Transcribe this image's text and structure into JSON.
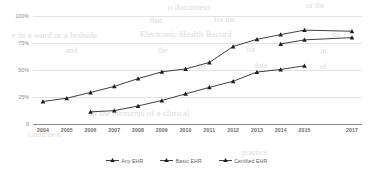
{
  "chart_data": {
    "type": "line",
    "title": "",
    "subtitle": "",
    "xlabel": "",
    "ylabel": "",
    "x": [
      2004,
      2005,
      2006,
      2007,
      2008,
      2009,
      2010,
      2011,
      2012,
      2013,
      2014,
      2015,
      2016,
      2017
    ],
    "tick_labels": [
      "2004",
      "2005",
      "2006",
      "2007",
      "2008",
      "2009",
      "2010",
      "2011",
      "2012",
      "2013",
      "2014",
      "2015",
      "2017"
    ],
    "ytick_labels": [
      "0",
      "25%",
      "50%",
      "75%",
      "100%"
    ],
    "ytick_values": [
      0,
      25,
      50,
      75,
      100
    ],
    "ylim": [
      0,
      100
    ],
    "grid": true,
    "legend_position": "bottom",
    "series": [
      {
        "name": "Any EHR",
        "marker": "triangle",
        "color": "#1f1f1f",
        "points": [
          {
            "x": 2004,
            "y": 20.8
          },
          {
            "x": 2005,
            "y": 23.9
          },
          {
            "x": 2006,
            "y": 29.2
          },
          {
            "x": 2007,
            "y": 34.8
          },
          {
            "x": 2008,
            "y": 42.0
          },
          {
            "x": 2009,
            "y": 48.3
          },
          {
            "x": 2010,
            "y": 51.0
          },
          {
            "x": 2011,
            "y": 57.0
          },
          {
            "x": 2012,
            "y": 71.8
          },
          {
            "x": 2013,
            "y": 78.4
          },
          {
            "x": 2014,
            "y": 82.8
          },
          {
            "x": 2015,
            "y": 86.9
          },
          {
            "x": 2017,
            "y": 85.9
          }
        ]
      },
      {
        "name": "Basic EHR",
        "marker": "triangle",
        "color": "#1f1f1f",
        "points": [
          {
            "x": 2006,
            "y": 11.2
          },
          {
            "x": 2007,
            "y": 12.4
          },
          {
            "x": 2008,
            "y": 16.7
          },
          {
            "x": 2009,
            "y": 21.8
          },
          {
            "x": 2010,
            "y": 27.9
          },
          {
            "x": 2011,
            "y": 33.9
          },
          {
            "x": 2012,
            "y": 39.6
          },
          {
            "x": 2013,
            "y": 48.1
          },
          {
            "x": 2014,
            "y": 50.5
          },
          {
            "x": 2015,
            "y": 53.9
          }
        ]
      },
      {
        "name": "Certified EHR",
        "marker": "triangle",
        "color": "#1f1f1f",
        "points": [
          {
            "x": 2014,
            "y": 74.1
          },
          {
            "x": 2015,
            "y": 77.9
          },
          {
            "x": 2017,
            "y": 80.0
          }
        ]
      }
    ]
  },
  "legend": {
    "items": [
      {
        "label": "Any EHR"
      },
      {
        "label": "Basic EHR"
      },
      {
        "label": "Certified EHR"
      }
    ]
  },
  "background_text": [
    {
      "text": "o document",
      "x": 168,
      "y": 2,
      "size": 9
    },
    {
      "text": "of the",
      "x": 306,
      "y": 1,
      "size": 8
    },
    {
      "text": "that",
      "x": 150,
      "y": 16,
      "size": 8
    },
    {
      "text": "for the",
      "x": 214,
      "y": 15,
      "size": 8
    },
    {
      "text": "e in a ward or a bedside",
      "x": 12,
      "y": 30,
      "size": 9
    },
    {
      "text": "Electronic Health Record",
      "x": 140,
      "y": 29,
      "size": 9
    },
    {
      "text": "no",
      "x": 332,
      "y": 30,
      "size": 8
    },
    {
      "text": "and",
      "x": 66,
      "y": 46,
      "size": 8
    },
    {
      "text": "the",
      "x": 158,
      "y": 46,
      "size": 8
    },
    {
      "text": "for",
      "x": 246,
      "y": 45,
      "size": 8
    },
    {
      "text": "in",
      "x": 320,
      "y": 46,
      "size": 8
    },
    {
      "text": "the",
      "x": 196,
      "y": 62,
      "size": 8
    },
    {
      "text": "data",
      "x": 254,
      "y": 61,
      "size": 8
    },
    {
      "text": "of",
      "x": 320,
      "y": 62,
      "size": 8
    },
    {
      "text": "all the elements of a clinical",
      "x": 88,
      "y": 108,
      "size": 9
    },
    {
      "text": "could be a",
      "x": 28,
      "y": 130,
      "size": 8
    },
    {
      "text": "practice",
      "x": 242,
      "y": 148,
      "size": 8
    }
  ]
}
